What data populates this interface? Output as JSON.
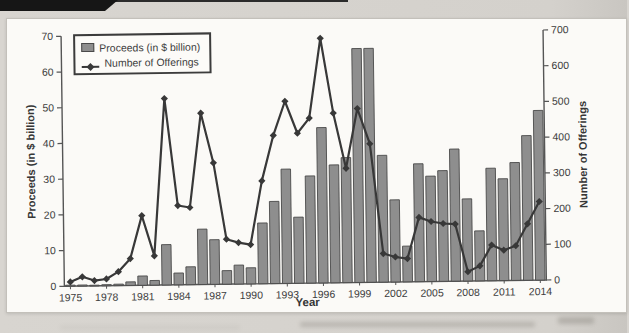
{
  "chart_data": {
    "type": "bar",
    "subtype": "combo-bar-line-dual-axis",
    "x": [
      1975,
      1976,
      1977,
      1978,
      1979,
      1980,
      1981,
      1982,
      1983,
      1984,
      1985,
      1986,
      1987,
      1988,
      1989,
      1990,
      1991,
      1992,
      1993,
      1994,
      1995,
      1996,
      1997,
      1998,
      1999,
      2000,
      2001,
      2002,
      2003,
      2004,
      2005,
      2006,
      2007,
      2008,
      2009,
      2010,
      2011,
      2012,
      2013,
      2014
    ],
    "series": [
      {
        "name": "Proceeds (in $ billion)",
        "render": "bar",
        "axis": "left",
        "values": [
          0.3,
          0.3,
          0.2,
          0.3,
          0.4,
          1.0,
          2.6,
          1.3,
          11.3,
          3.3,
          5.0,
          15.5,
          12.5,
          3.8,
          5.3,
          4.5,
          17.0,
          23.0,
          32.0,
          18.5,
          30.0,
          43.5,
          33.0,
          35.0,
          65.5,
          65.5,
          35.5,
          23.0,
          10.0,
          33.0,
          29.5,
          31.0,
          37.0,
          23.0,
          14.0,
          31.5,
          28.5,
          33.0,
          40.5,
          47.5
        ]
      },
      {
        "name": "Number of Offerings",
        "render": "line",
        "axis": "right",
        "values": [
          12,
          26,
          15,
          19,
          39,
          75,
          195,
          82,
          522,
          222,
          216,
          480,
          340,
          126,
          116,
          110,
          288,
          415,
          510,
          420,
          462,
          685,
          475,
          320,
          487,
          388,
          80,
          70,
          65,
          180,
          168,
          162,
          160,
          26,
          42,
          100,
          85,
          97,
          158,
          220
        ]
      }
    ],
    "title": "",
    "xlabel": "Year",
    "ylabel_left": "Proceeds (in $ billion)",
    "ylabel_right": "Number of Offerings",
    "ylim_left": [
      0,
      70
    ],
    "ylim_right": [
      0,
      700
    ],
    "yticks_left": [
      0,
      10,
      20,
      30,
      40,
      50,
      60,
      70
    ],
    "yticks_right": [
      0,
      100,
      200,
      300,
      400,
      500,
      600,
      700
    ],
    "xticks": [
      1975,
      1978,
      1981,
      1984,
      1987,
      1990,
      1993,
      1996,
      1999,
      2002,
      2005,
      2008,
      2011,
      2014
    ],
    "grid": false,
    "legend_position": "top-left",
    "colors": {
      "bar_fill": "#8e8e8e",
      "bar_border": "#4a4a4a",
      "line": "#383838",
      "axis": "#555555",
      "text": "#3d3d3d",
      "panel_bg": "#fbfaf7",
      "page_bg": "#d5d2cd",
      "corner_tab": "#161616"
    }
  }
}
